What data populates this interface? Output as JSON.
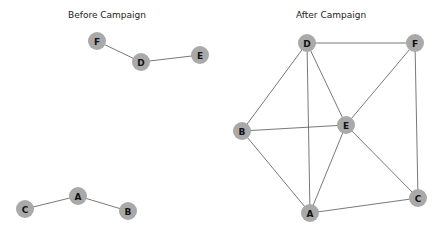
{
  "figure": {
    "width": 444,
    "height": 234,
    "node_color": "#a9a9a9",
    "edge_color": "#555555",
    "label_color": "#111111",
    "node_radius": 9
  },
  "panels": [
    {
      "id": "before",
      "title": "Before Campaign",
      "title_x": 107,
      "nodes": [
        {
          "id": "F",
          "label": "F",
          "x": 97,
          "y": 41
        },
        {
          "id": "D",
          "label": "D",
          "x": 141,
          "y": 62
        },
        {
          "id": "E",
          "label": "E",
          "x": 200,
          "y": 55
        },
        {
          "id": "C",
          "label": "C",
          "x": 25,
          "y": 209
        },
        {
          "id": "A",
          "label": "A",
          "x": 78,
          "y": 196
        },
        {
          "id": "B",
          "label": "B",
          "x": 128,
          "y": 211
        }
      ],
      "edges": [
        [
          "F",
          "D"
        ],
        [
          "D",
          "E"
        ],
        [
          "C",
          "A"
        ],
        [
          "A",
          "B"
        ]
      ]
    },
    {
      "id": "after",
      "title": "After Campaign",
      "title_x": 331,
      "nodes": [
        {
          "id": "D",
          "label": "D",
          "x": 307,
          "y": 43
        },
        {
          "id": "F",
          "label": "F",
          "x": 415,
          "y": 43
        },
        {
          "id": "B",
          "label": "B",
          "x": 242,
          "y": 131
        },
        {
          "id": "E",
          "label": "E",
          "x": 346,
          "y": 125
        },
        {
          "id": "A",
          "label": "A",
          "x": 310,
          "y": 213
        },
        {
          "id": "C",
          "label": "C",
          "x": 418,
          "y": 198
        }
      ],
      "edges": [
        [
          "D",
          "F"
        ],
        [
          "D",
          "B"
        ],
        [
          "D",
          "A"
        ],
        [
          "D",
          "E"
        ],
        [
          "F",
          "E"
        ],
        [
          "F",
          "C"
        ],
        [
          "B",
          "E"
        ],
        [
          "B",
          "A"
        ],
        [
          "E",
          "A"
        ],
        [
          "E",
          "C"
        ],
        [
          "A",
          "C"
        ]
      ]
    }
  ]
}
